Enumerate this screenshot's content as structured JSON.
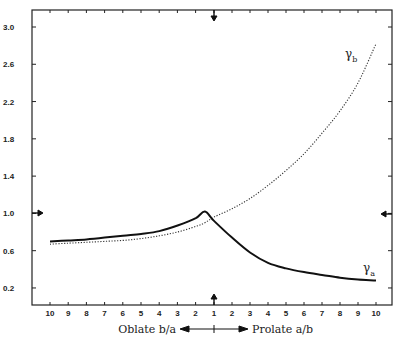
{
  "chart_data": {
    "type": "line",
    "title": "",
    "xlabel_left": "Oblate b/a",
    "xlabel_right": "Prolate a/b",
    "ylabel": "",
    "x_tick_labels": [
      "10",
      "9",
      "8",
      "7",
      "6",
      "5",
      "4",
      "3",
      "2",
      "1",
      "2",
      "3",
      "4",
      "5",
      "6",
      "7",
      "8",
      "9",
      "10"
    ],
    "y_tick_labels": [
      "3.0",
      "2.6",
      "2.2",
      "1.8",
      "1.4",
      "1.0",
      "0.6",
      "0.2"
    ],
    "y_ticks": [
      3.0,
      2.6,
      2.2,
      1.8,
      1.4,
      1.0,
      0.6,
      0.2
    ],
    "ylim": [
      0.0,
      3.2
    ],
    "grid": false,
    "markers": {
      "x_axis_ratio": 1,
      "y_value": 1.0
    },
    "x": [
      -10,
      -9,
      -8,
      -7,
      -6,
      -5,
      -4,
      -3,
      -2,
      -1.5,
      1,
      2,
      3,
      4,
      5,
      6,
      7,
      8,
      9,
      10
    ],
    "series": [
      {
        "name": "γa",
        "style": "solid",
        "values": [
          0.7,
          0.71,
          0.72,
          0.74,
          0.76,
          0.78,
          0.81,
          0.87,
          0.95,
          1.02,
          0.92,
          0.74,
          0.58,
          0.47,
          0.41,
          0.37,
          0.34,
          0.31,
          0.29,
          0.28
        ]
      },
      {
        "name": "γb",
        "style": "dotted",
        "values": [
          0.67,
          0.68,
          0.69,
          0.7,
          0.71,
          0.73,
          0.76,
          0.8,
          0.86,
          0.9,
          0.96,
          1.05,
          1.16,
          1.3,
          1.46,
          1.64,
          1.86,
          2.1,
          2.4,
          2.82
        ]
      }
    ]
  },
  "labels": {
    "gamma_b": "γ",
    "gamma_b_sub": "b",
    "gamma_a": "γ",
    "gamma_a_sub": "a"
  }
}
